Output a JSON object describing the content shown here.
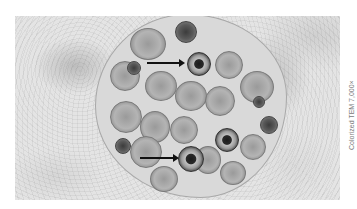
{
  "figure": {
    "caption": "Colorized TEM 7,000×",
    "arrows": [
      {
        "from": [
          147,
          63
        ],
        "to": [
          184,
          63
        ],
        "points_to": "dense-ringed-body-upper"
      },
      {
        "from": [
          140,
          158
        ],
        "to": [
          178,
          158
        ],
        "points_to": "dense-ringed-body-lower"
      }
    ],
    "colors": {
      "background": "#ffffff",
      "cytoplasm": "#e4e4e4",
      "vacuole": "#d9d9d9",
      "arrow": "#111111",
      "caption_text": "#7a7a7a"
    }
  }
}
